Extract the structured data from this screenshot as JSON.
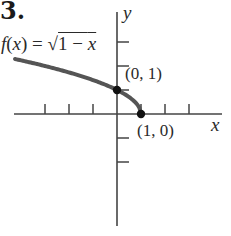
{
  "problem_number": "3.",
  "function_label": {
    "prefix": "f(x) = ",
    "radical_symbol": "√",
    "radicand": "1 − x"
  },
  "axes": {
    "x_label": "x",
    "y_label": "y",
    "origin_px": [
      117,
      114
    ],
    "unit_px": 24,
    "x_range_px": [
      14,
      222
    ],
    "y_range_px": [
      12,
      226
    ],
    "x_ticks": [
      -3,
      -2,
      -1,
      1,
      2,
      3
    ],
    "y_ticks": [
      3,
      2,
      1,
      -1,
      -2
    ]
  },
  "points": [
    {
      "label": "(0, 1)",
      "x": 0,
      "y": 1
    },
    {
      "label": "(1, 0)",
      "x": 1,
      "y": 0
    }
  ],
  "curve": {
    "equation": "y = sqrt(1 - x)",
    "domain": [
      -4.25,
      1
    ],
    "color": "#555555"
  }
}
